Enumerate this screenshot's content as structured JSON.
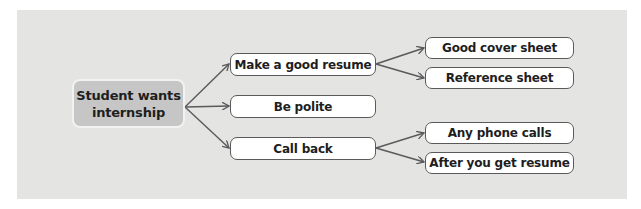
{
  "diagram": {
    "type": "mind-map",
    "root": {
      "label_line1": "Student wants",
      "label_line2": "internship"
    },
    "branches": [
      {
        "label": "Make a good resume",
        "children": [
          {
            "label": "Good cover sheet"
          },
          {
            "label": "Reference sheet"
          }
        ]
      },
      {
        "label": "Be polite",
        "children": []
      },
      {
        "label": "Call back",
        "children": [
          {
            "label": "Any phone calls"
          },
          {
            "label": "After you get resume"
          }
        ]
      }
    ]
  },
  "colors": {
    "panel_background": "#e4e4e3",
    "root_fill": "#c6c6c6",
    "node_fill": "#ffffff",
    "node_border": "#5a5a5a",
    "connector": "#5a5a5a"
  }
}
